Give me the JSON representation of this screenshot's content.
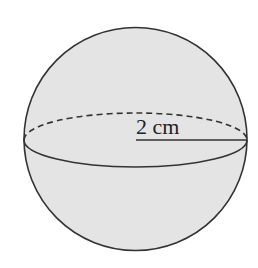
{
  "diagram": {
    "type": "sphere",
    "label": "2 cm",
    "measurement": "radius",
    "colors": {
      "fill": "#e4e4e4",
      "stroke": "#333333",
      "text": "#222222",
      "background": "#ffffff"
    }
  }
}
